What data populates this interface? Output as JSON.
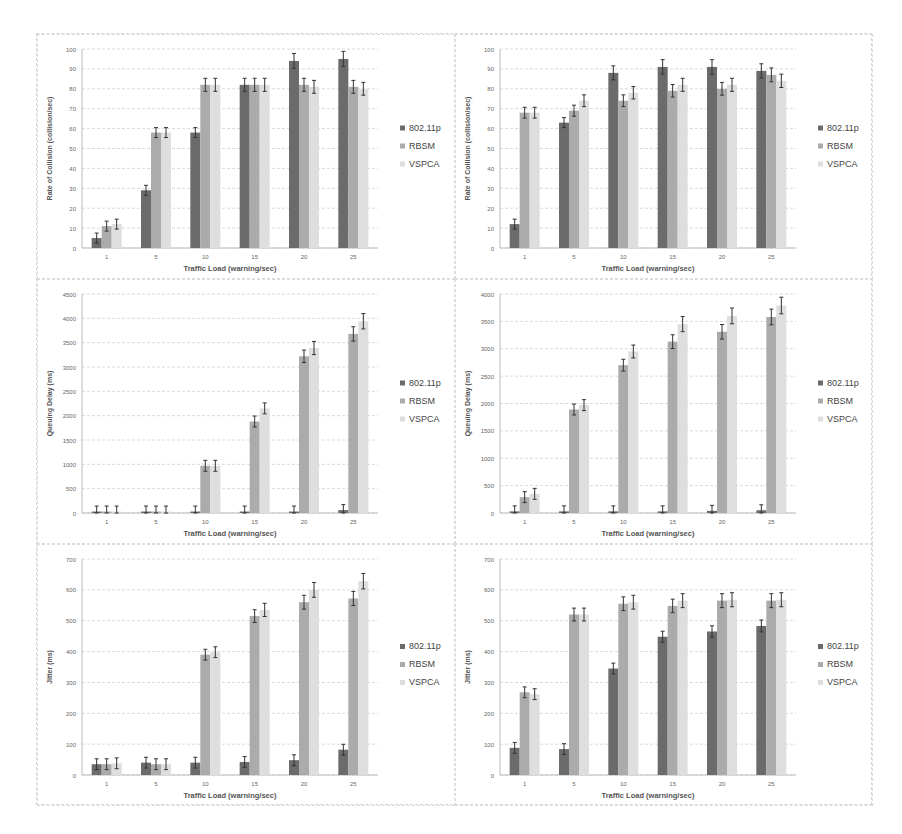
{
  "figure": {
    "x_label": "Traffic Load (warning/sec)",
    "legend": [
      "802.11p",
      "RBSM",
      "VSPCA"
    ],
    "colors": {
      "802.11p": "#6b6b6b",
      "RBSM": "#ababab",
      "VSPCA": "#dedede"
    }
  },
  "chart_data": [
    {
      "type": "bar",
      "title": "",
      "xlabel": "Traffic Load (warning/sec)",
      "ylabel": "Rate of Collision (collision/sec)",
      "categories": [
        "1",
        "5",
        "10",
        "15",
        "20",
        "25"
      ],
      "ylim": [
        0,
        100
      ],
      "ytick_step": 10,
      "grid": true,
      "legend_position": "right",
      "error_bars": true,
      "series": [
        {
          "name": "802.11p",
          "values": [
            5,
            29,
            58,
            82,
            94,
            95
          ]
        },
        {
          "name": "RBSM",
          "values": [
            11,
            58,
            82,
            82,
            82,
            81
          ]
        },
        {
          "name": "VSPCA",
          "values": [
            12,
            58,
            82,
            82,
            81,
            80
          ]
        }
      ]
    },
    {
      "type": "bar",
      "title": "",
      "xlabel": "Traffic Load (warning/sec)",
      "ylabel": "Rate of Collision (collision/sec)",
      "categories": [
        "1",
        "5",
        "10",
        "15",
        "20",
        "25"
      ],
      "ylim": [
        0,
        100
      ],
      "ytick_step": 10,
      "grid": true,
      "legend_position": "right",
      "error_bars": true,
      "series": [
        {
          "name": "802.11p",
          "values": [
            12,
            63,
            88,
            91,
            91,
            89
          ]
        },
        {
          "name": "RBSM",
          "values": [
            68,
            69,
            74,
            79,
            80,
            87
          ]
        },
        {
          "name": "VSPCA",
          "values": [
            68,
            74,
            78,
            82,
            82,
            84
          ]
        }
      ]
    },
    {
      "type": "bar",
      "title": "",
      "xlabel": "Traffic Load (warning/sec)",
      "ylabel": "Queuing Delay (ms)",
      "categories": [
        "1",
        "5",
        "10",
        "15",
        "20",
        "25"
      ],
      "ylim": [
        0,
        4500
      ],
      "ytick_step": 500,
      "grid": true,
      "legend_position": "right",
      "error_bars": true,
      "series": [
        {
          "name": "802.11p",
          "values": [
            30,
            30,
            30,
            30,
            30,
            60
          ]
        },
        {
          "name": "RBSM",
          "values": [
            30,
            30,
            970,
            1880,
            3220,
            3680
          ]
        },
        {
          "name": "VSPCA",
          "values": [
            30,
            30,
            970,
            2150,
            3390,
            3940
          ]
        }
      ]
    },
    {
      "type": "bar",
      "title": "",
      "xlabel": "Traffic Load (warning/sec)",
      "ylabel": "Queuing Delay (ms)",
      "categories": [
        "1",
        "5",
        "10",
        "15",
        "20",
        "25"
      ],
      "ylim": [
        0,
        4000
      ],
      "ytick_step": 500,
      "grid": true,
      "legend_position": "right",
      "error_bars": true,
      "series": [
        {
          "name": "802.11p",
          "values": [
            30,
            30,
            30,
            30,
            40,
            50
          ]
        },
        {
          "name": "RBSM",
          "values": [
            290,
            1890,
            2700,
            3130,
            3310,
            3580
          ]
        },
        {
          "name": "VSPCA",
          "values": [
            350,
            1970,
            2950,
            3450,
            3600,
            3790
          ]
        }
      ]
    },
    {
      "type": "bar",
      "title": "",
      "xlabel": "Traffic Load (warning/sec)",
      "ylabel": "Jitter (ms)",
      "categories": [
        "1",
        "5",
        "10",
        "15",
        "20",
        "25"
      ],
      "ylim": [
        0,
        700
      ],
      "ytick_step": 100,
      "grid": true,
      "legend_position": "right",
      "error_bars": true,
      "series": [
        {
          "name": "802.11p",
          "values": [
            35,
            40,
            40,
            42,
            48,
            82
          ]
        },
        {
          "name": "RBSM",
          "values": [
            35,
            35,
            390,
            515,
            560,
            572
          ]
        },
        {
          "name": "VSPCA",
          "values": [
            38,
            35,
            398,
            535,
            600,
            628
          ]
        }
      ]
    },
    {
      "type": "bar",
      "title": "",
      "xlabel": "Traffic Load (warning/sec)",
      "ylabel": "Jitter (ms)",
      "categories": [
        "1",
        "5",
        "10",
        "15",
        "20",
        "25"
      ],
      "ylim": [
        0,
        700
      ],
      "ytick_step": 100,
      "grid": true,
      "legend_position": "right",
      "error_bars": true,
      "series": [
        {
          "name": "802.11p",
          "values": [
            88,
            84,
            345,
            448,
            465,
            483
          ]
        },
        {
          "name": "RBSM",
          "values": [
            268,
            520,
            555,
            548,
            565,
            565
          ]
        },
        {
          "name": "VSPCA",
          "values": [
            262,
            520,
            560,
            565,
            568,
            568
          ]
        }
      ]
    }
  ]
}
